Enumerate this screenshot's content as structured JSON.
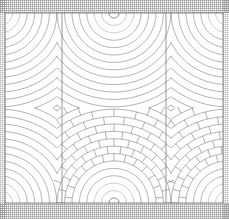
{
  "figure": {
    "canvas": {
      "width": 229,
      "height": 219
    },
    "background_color": "#ffffff",
    "line_color": "#6e6e76",
    "line_color_light": "#9a9aa2",
    "line_color_seam": "#55555d",
    "line_width": 0.55,
    "seam_line_width": 0.6,
    "frame": {
      "visible": true,
      "color": "#5a5a62",
      "left": 5,
      "top": 13,
      "right": 223,
      "bottom": 203
    },
    "edge_bands": [
      {
        "name": "top-halftone-band",
        "y": 0,
        "height": 13,
        "tone": "#787878"
      },
      {
        "name": "bottom-halftone-band",
        "y": 203,
        "height": 16,
        "tone": "#787878"
      },
      {
        "name": "left-halftone-band",
        "x": 0,
        "width": 6,
        "tone": "#787878"
      },
      {
        "name": "right-halftone-band",
        "x": 223,
        "width": 6,
        "tone": "#787878"
      }
    ]
  },
  "geometry": {
    "pitch": 114,
    "ring_count": 17,
    "ring_min_radius": 5,
    "ring_step": 7.4,
    "arc_max_radius": 130,
    "notch_radius": 5,
    "centers_top": [
      {
        "name": "top-left-springer",
        "cx": 0,
        "cy": 13,
        "brick": false
      },
      {
        "name": "top-centre-springer",
        "cx": 114,
        "cy": 13,
        "brick": false
      },
      {
        "name": "top-right-springer",
        "cx": 228,
        "cy": 13,
        "brick": false
      }
    ],
    "centers_bottom": [
      {
        "name": "bottom-left-springer",
        "cx": 0,
        "cy": 203,
        "brick": false
      },
      {
        "name": "bottom-centre-springer",
        "cx": 114,
        "cy": 203,
        "brick": true
      },
      {
        "name": "bottom-right-springer",
        "cx": 228,
        "cy": 203,
        "brick": true
      }
    ],
    "seams_vertical": [
      {
        "name": "seam-left",
        "x": 62,
        "y1": 13,
        "y2": 203
      },
      {
        "name": "seam-right",
        "x": 166,
        "y1": 13,
        "y2": 203
      }
    ],
    "brick": {
      "enabled_on": "bottom-centre-springer",
      "radial_joint_count": 13,
      "stagger": true,
      "inner_plain_rings": 5,
      "joint_color": "#6e6e76"
    }
  },
  "labels": {
    "caption": "",
    "plate_number": ""
  }
}
